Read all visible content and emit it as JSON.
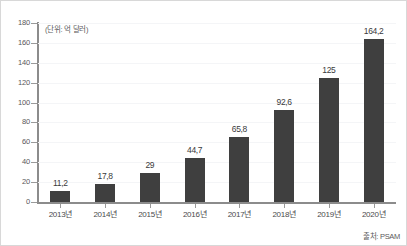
{
  "figure": {
    "unit_label": "(단위: 억 달러)",
    "source_label": "출처: PSAM",
    "background_color": "#ffffff",
    "bar_color": "#3f3f3f",
    "axis_color": "#8c8c8c",
    "gridline_color": "#f4f5f7",
    "border_color": "#d8d8d8"
  },
  "chart_data": {
    "type": "bar",
    "title": "",
    "subtitle": "",
    "xlabel": "",
    "ylabel": "",
    "unit": "(단위: 억 달러)",
    "source": "출처: PSAM",
    "categories": [
      "2013년",
      "2014년",
      "2015년",
      "2016년",
      "2017년",
      "2018년",
      "2019년",
      "2020년"
    ],
    "values": [
      11.2,
      17.8,
      29,
      44.7,
      65.8,
      92.6,
      125,
      164.2
    ],
    "value_labels": [
      "11,2",
      "17,8",
      "29",
      "44,7",
      "65,8",
      "92,6",
      "125",
      "164,2"
    ],
    "ylim": [
      0,
      180
    ],
    "yticks": [
      0,
      20,
      40,
      60,
      80,
      100,
      120,
      140,
      160,
      180
    ],
    "ytick_labels": [
      "0",
      "20",
      "40",
      "60",
      "80",
      "100",
      "120",
      "140",
      "160",
      "180"
    ],
    "grid": true,
    "legend": false,
    "legend_position": "none",
    "series": [
      {
        "name": "",
        "color": "#3f3f3f",
        "values": [
          11.2,
          17.8,
          29,
          44.7,
          65.8,
          92.6,
          125,
          164.2
        ]
      }
    ]
  }
}
